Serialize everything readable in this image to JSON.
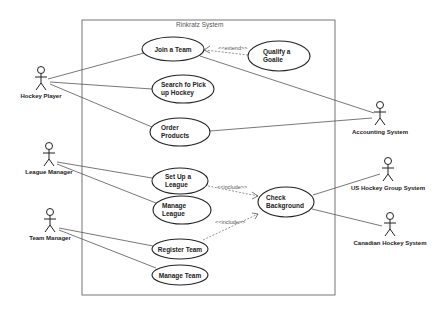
{
  "diagram": {
    "type": "uml-use-case",
    "system_boundary": {
      "title": "Rinkratz System",
      "x": 82,
      "y": 20,
      "width": 253,
      "height": 275
    },
    "actors": [
      {
        "id": "hockey-player",
        "label": "Hockey Player",
        "x": 40,
        "y": 70
      },
      {
        "id": "league-manager",
        "label": "League Manager",
        "x": 48,
        "y": 146
      },
      {
        "id": "team-manager",
        "label": "Team Manager",
        "x": 50,
        "y": 212
      },
      {
        "id": "accounting-system",
        "label": "Accounting System",
        "x": 382,
        "y": 106
      },
      {
        "id": "us-hockey-group-system",
        "label": "US Hockey Group System",
        "x": 388,
        "y": 162
      },
      {
        "id": "canadian-hockey-system",
        "label": "Canadian Hockey System",
        "x": 390,
        "y": 217
      }
    ],
    "use_cases": [
      {
        "id": "join-a-team",
        "lines": [
          "Join a Team"
        ],
        "cx": 173,
        "cy": 49,
        "rx": 31,
        "ry": 12
      },
      {
        "id": "qualify-a-goalie",
        "lines": [
          "Qualify a",
          "Goalie"
        ],
        "cx": 279,
        "cy": 56,
        "rx": 31,
        "ry": 15
      },
      {
        "id": "search-pick-up-hockey",
        "lines": [
          "Search fo Pick",
          "up Hockey"
        ],
        "cx": 183,
        "cy": 89,
        "rx": 31,
        "ry": 14
      },
      {
        "id": "order-products",
        "lines": [
          "Order",
          "Products"
        ],
        "cx": 180,
        "cy": 132,
        "rx": 30,
        "ry": 14
      },
      {
        "id": "set-up-a-league",
        "lines": [
          "Set Up a",
          "League"
        ],
        "cx": 180,
        "cy": 181,
        "rx": 28,
        "ry": 13
      },
      {
        "id": "manage-league",
        "lines": [
          "Manage",
          "League"
        ],
        "cx": 182,
        "cy": 210,
        "rx": 29,
        "ry": 14
      },
      {
        "id": "check-background",
        "lines": [
          "Check",
          "Background"
        ],
        "cx": 286,
        "cy": 202,
        "rx": 28,
        "ry": 15
      },
      {
        "id": "register-team",
        "lines": [
          "Register Team"
        ],
        "cx": 180,
        "cy": 249,
        "rx": 28,
        "ry": 10
      },
      {
        "id": "manage-team",
        "lines": [
          "Manage Team"
        ],
        "cx": 180,
        "cy": 275,
        "rx": 28,
        "ry": 10
      }
    ],
    "associations": [
      {
        "from": "hockey-player",
        "to": "join-a-team"
      },
      {
        "from": "hockey-player",
        "to": "search-pick-up-hockey"
      },
      {
        "from": "hockey-player",
        "to": "order-products"
      },
      {
        "from": "league-manager",
        "to": "set-up-a-league"
      },
      {
        "from": "league-manager",
        "to": "manage-league"
      },
      {
        "from": "team-manager",
        "to": "register-team"
      },
      {
        "from": "team-manager",
        "to": "manage-team"
      },
      {
        "from": "join-a-team",
        "to": "accounting-system"
      },
      {
        "from": "order-products",
        "to": "accounting-system"
      },
      {
        "from": "check-background",
        "to": "us-hockey-group-system"
      },
      {
        "from": "check-background",
        "to": "canadian-hockey-system"
      }
    ],
    "dependencies": [
      {
        "from": "qualify-a-goalie",
        "to": "join-a-team",
        "stereotype": "<<extend>>"
      },
      {
        "from": "set-up-a-league",
        "to": "check-background",
        "stereotype": "<<include>>"
      },
      {
        "from": "register-team",
        "to": "check-background",
        "stereotype": "<<include>>"
      }
    ]
  },
  "labels": {
    "title": "Rinkratz System",
    "actors": {
      "hockey_player": "Hockey Player",
      "league_manager": "League Manager",
      "team_manager": "Team Manager",
      "accounting_system": "Accounting System",
      "us_hockey_group_system": "US Hockey Group System",
      "canadian_hockey_system": "Canadian Hockey System"
    },
    "use_cases": {
      "join_a_team": "Join a Team",
      "qualify_a_goalie_1": "Qualify a",
      "qualify_a_goalie_2": "Goalie",
      "search_1": "Search fo Pick",
      "search_2": "up Hockey",
      "order_1": "Order",
      "order_2": "Products",
      "setup_1": "Set Up a",
      "setup_2": "League",
      "manage_league_1": "Manage",
      "manage_league_2": "League",
      "check_1": "Check",
      "check_2": "Background",
      "register_team": "Register Team",
      "manage_team": "Manage Team"
    },
    "stereotypes": {
      "extend": "<<extend>>",
      "include_1": "<<include>>",
      "include_2": "<<include>>"
    }
  }
}
